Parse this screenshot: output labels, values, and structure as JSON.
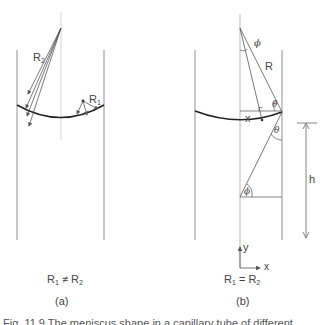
{
  "figure": {
    "panel_a": {
      "radius_large_label": "R",
      "radius_large_sub": "2",
      "radius_small_label": "R",
      "radius_small_sub": "1",
      "condition_left": "R",
      "condition_left_sub1": "1",
      "condition_op": " ≠ ",
      "condition_right": "R",
      "condition_right_sub": "2",
      "panel_label": "(a)"
    },
    "panel_b": {
      "angle_phi_top": "ϕ",
      "radius_label": "R",
      "small_r_label": "r",
      "theta_top": "θ",
      "x_label": "x",
      "theta_lower": "θ",
      "phi_bottom": "ϕ",
      "height_label": "h",
      "axis_y": "y",
      "axis_x": "x",
      "condition_left": "R",
      "condition_left_sub1": "1",
      "condition_op": " = ",
      "condition_right": "R",
      "condition_right_sub": "2",
      "panel_label": "(b)"
    },
    "caption_partial": "Fig. 11.9  The meniscus shape in a capillary tube of different …"
  }
}
